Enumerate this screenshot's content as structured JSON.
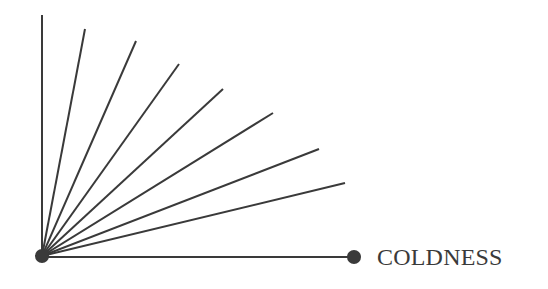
{
  "diagram": {
    "axis_label": "COLDNESS",
    "line_color": "#3a3a3a",
    "origin": {
      "x": 42,
      "y": 256
    },
    "x_axis_end": {
      "x": 354,
      "y": 257
    },
    "y_axis_top": {
      "x": 42,
      "y": 15
    },
    "rays": [
      {
        "x": 85,
        "y": 29
      },
      {
        "x": 136,
        "y": 41
      },
      {
        "x": 179,
        "y": 64
      },
      {
        "x": 223,
        "y": 89
      },
      {
        "x": 273,
        "y": 113
      },
      {
        "x": 319,
        "y": 149
      },
      {
        "x": 345,
        "y": 183
      }
    ]
  }
}
